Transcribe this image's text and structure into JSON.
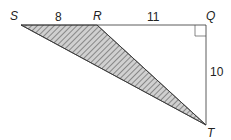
{
  "diagram": {
    "type": "geometry-triangle",
    "points": {
      "S": {
        "label": "S",
        "x": 21,
        "y": 25
      },
      "R": {
        "label": "R",
        "x": 97,
        "y": 25
      },
      "Q": {
        "label": "Q",
        "x": 206,
        "y": 25
      },
      "T": {
        "label": "T",
        "x": 206,
        "y": 125
      }
    },
    "segments": {
      "SR": "8",
      "RQ": "11",
      "QT": "10"
    },
    "shaded_region": "triangle SRT",
    "right_angle_at": "Q",
    "colors": {
      "stroke": "#333333",
      "hatch": "#555555",
      "fill": "#d0d0d0"
    }
  }
}
